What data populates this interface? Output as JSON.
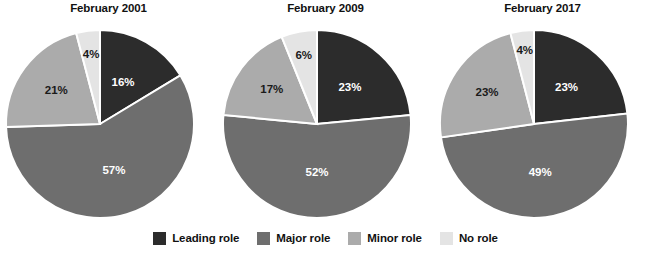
{
  "chart_data": {
    "type": "pie",
    "title": "",
    "legend_position": "bottom",
    "categories": [
      "Leading role",
      "Major role",
      "Minor role",
      "No role"
    ],
    "colors": [
      "#2c2c2c",
      "#6e6e6e",
      "#ababab",
      "#e4e4e4"
    ],
    "label_suffix": "%",
    "charts": [
      {
        "title": "February 2001",
        "values": [
          16,
          57,
          21,
          4
        ],
        "labels": [
          "16%",
          "57%",
          "21%",
          "4%"
        ]
      },
      {
        "title": "February 2009",
        "values": [
          23,
          52,
          17,
          6
        ],
        "labels": [
          "23%",
          "52%",
          "17%",
          "6%"
        ]
      },
      {
        "title": "February 2017",
        "values": [
          23,
          49,
          23,
          4
        ],
        "labels": [
          "23%",
          "49%",
          "23%",
          "4%"
        ]
      }
    ]
  },
  "legend": {
    "items": [
      {
        "label": "Leading role",
        "color": "#2c2c2c"
      },
      {
        "label": "Major role",
        "color": "#6e6e6e"
      },
      {
        "label": "Minor role",
        "color": "#ababab"
      },
      {
        "label": "No role",
        "color": "#e4e4e4"
      }
    ]
  }
}
